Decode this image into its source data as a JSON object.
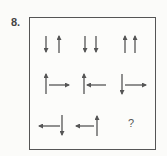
{
  "question": {
    "number_label": "8.",
    "missing_label": "?"
  },
  "colors": {
    "stroke": "#555555",
    "border": "#555555",
    "background": "#fbfbf9"
  },
  "grid": {
    "rows": [
      [
        "down-up",
        "down-down",
        "up-up"
      ],
      [
        "up-right",
        "up-left",
        "down-right"
      ],
      [
        "left-down",
        "left-up",
        "missing"
      ]
    ]
  }
}
